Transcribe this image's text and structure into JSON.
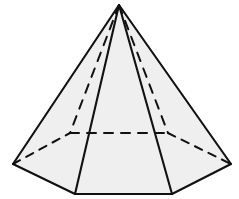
{
  "figure": {
    "kind": "solid-geometry-line-drawing",
    "canvas": {
      "width": 239,
      "height": 199,
      "background": "#ffffff"
    },
    "style": {
      "face_fill": "#efefef",
      "stroke_color": "#111111",
      "visible_stroke_width": 2.1,
      "hidden_stroke_width": 2.0,
      "hidden_dash_pattern": "9 8",
      "hidden_dash_pattern_short": "8 7"
    },
    "apex": {
      "name": "apex",
      "x": 119,
      "y": 5
    },
    "base_vertices": [
      {
        "name": "front-left-bottom",
        "x": 75,
        "y": 194,
        "visible": true
      },
      {
        "name": "front-right-bottom",
        "x": 172,
        "y": 194,
        "visible": true
      },
      {
        "name": "right-outer",
        "x": 231,
        "y": 164,
        "visible": true
      },
      {
        "name": "back-right-hidden",
        "x": 168,
        "y": 133,
        "visible": false
      },
      {
        "name": "back-center-left-hidden",
        "x": 70,
        "y": 133,
        "visible": false
      },
      {
        "name": "left-outer",
        "x": 13,
        "y": 164,
        "visible": true
      }
    ],
    "visible_faces": [
      {
        "name": "front-face",
        "points": "119,5 172,194 75,194"
      },
      {
        "name": "left-face",
        "points": "119,5 75,194 13,164"
      },
      {
        "name": "right-face",
        "points": "119,5 231,164 172,194"
      }
    ],
    "visible_edges": [
      {
        "name": "lateral-edge-left-outer",
        "x1": 119,
        "y1": 5,
        "x2": 13,
        "y2": 164
      },
      {
        "name": "lateral-edge-right-outer",
        "x1": 119,
        "y1": 5,
        "x2": 231,
        "y2": 164
      },
      {
        "name": "lateral-edge-front-left",
        "x1": 119,
        "y1": 5,
        "x2": 75,
        "y2": 194
      },
      {
        "name": "lateral-edge-front-right",
        "x1": 119,
        "y1": 5,
        "x2": 172,
        "y2": 194
      },
      {
        "name": "base-edge-front",
        "x1": 75,
        "y1": 194,
        "x2": 172,
        "y2": 194
      },
      {
        "name": "base-edge-front-left",
        "x1": 13,
        "y1": 164,
        "x2": 75,
        "y2": 194
      },
      {
        "name": "base-edge-front-right",
        "x1": 172,
        "y1": 194,
        "x2": 231,
        "y2": 164
      }
    ],
    "hidden_edges": [
      {
        "name": "hidden-lateral-edge-left",
        "x1": 119,
        "y1": 5,
        "x2": 70,
        "y2": 133
      },
      {
        "name": "hidden-lateral-edge-right",
        "x1": 119,
        "y1": 5,
        "x2": 168,
        "y2": 133
      },
      {
        "name": "hidden-base-edge-back",
        "x1": 70,
        "y1": 133,
        "x2": 168,
        "y2": 133
      },
      {
        "name": "hidden-base-edge-back-left",
        "x1": 13,
        "y1": 164,
        "x2": 70,
        "y2": 133
      },
      {
        "name": "hidden-base-edge-back-right",
        "x1": 168,
        "y1": 133,
        "x2": 231,
        "y2": 164
      }
    ]
  }
}
